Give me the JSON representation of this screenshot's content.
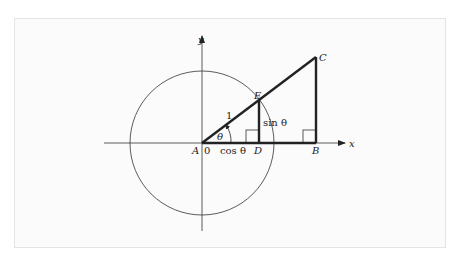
{
  "figure": {
    "type": "unit-circle-trigonometry-diagram",
    "axes": {
      "x_label": "x",
      "y_label": "y",
      "origin_label": "0"
    },
    "points": {
      "A": "A",
      "B": "B",
      "C": "C",
      "D": "D",
      "E": "E"
    },
    "segment_labels": {
      "hypotenuse_AE": "1",
      "adjacent_AD": "cos θ",
      "opposite_ED": "sin θ"
    },
    "angle_label": "θ",
    "colors": {
      "stroke": "#222222",
      "background": "#fbfbfb",
      "frame_border": "#e4e4e4"
    }
  }
}
